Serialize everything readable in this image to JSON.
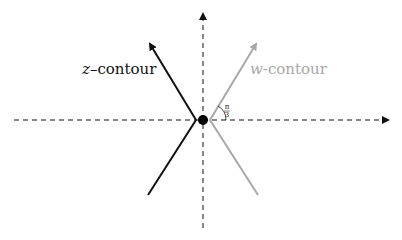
{
  "diagram": {
    "labels": {
      "z_var": "z",
      "z_suffix": "–contour",
      "w_var": "w",
      "w_suffix": "-contour",
      "angle_num": "π",
      "angle_den": "3"
    },
    "colors": {
      "z_contour": "#111111",
      "w_contour": "#a8a8a8",
      "axes": "#111111",
      "origin": "#000000"
    }
  }
}
